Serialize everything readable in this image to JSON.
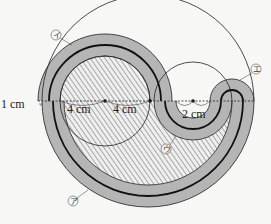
{
  "diagram": {
    "type": "geometry-figure",
    "labels": {
      "one_cm": "1 cm",
      "four_cm_left": "4 cm",
      "four_cm_right": "4 cm",
      "two_cm": "2 cm"
    },
    "markers": {
      "a": "ア",
      "i": "イ",
      "u": "ウ",
      "e": "エ"
    },
    "colors": {
      "band": "#b5b5b5",
      "band_dark": "#a8a8a8",
      "hatch_line": "#8a8a8a",
      "line": "#1a1a1a",
      "background": "#f7f7f5"
    }
  }
}
